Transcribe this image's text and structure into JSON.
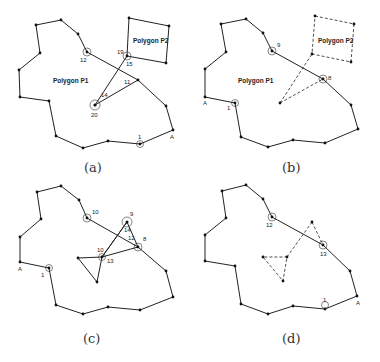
{
  "figure": {
    "panels": [
      {
        "id": "a",
        "caption": "(a)",
        "polygon_labels": [
          "Polygon P1",
          "Polygon P2"
        ],
        "vertex_labels": [
          "12",
          "19",
          "15",
          "11",
          "14",
          "20",
          "1",
          "A"
        ]
      },
      {
        "id": "b",
        "caption": "(b)",
        "polygon_labels": [
          "Polygon P1",
          "Polygon P2"
        ],
        "vertex_labels": [
          "9",
          "8",
          "1",
          "A"
        ]
      },
      {
        "id": "c",
        "caption": "(c)",
        "polygon_labels": [],
        "vertex_labels": [
          "10",
          "9",
          "8",
          "13",
          "10",
          "12",
          "14",
          "1",
          "A"
        ]
      },
      {
        "id": "d",
        "caption": "(d)",
        "polygon_labels": [],
        "vertex_labels": [
          "12",
          "13",
          "1",
          "A"
        ]
      }
    ]
  },
  "a": {
    "caption": "(a)",
    "p1": "Polygon P1",
    "p2": "Polygon P2",
    "l12": "12",
    "l19": "19",
    "l15": "15",
    "l11": "11",
    "l14": "14",
    "l20": "20",
    "l1": "1",
    "lA": "A"
  },
  "b": {
    "caption": "(b)",
    "p1": "Polygon P1",
    "p2": "Polygon P2",
    "l9": "9",
    "l8": "8",
    "l1": "1",
    "lA": "A"
  },
  "c": {
    "caption": "(c)",
    "l10": "10",
    "l9": "9",
    "l8": "8",
    "l13": "13",
    "l10b": "10",
    "l12": "12",
    "l14": "14",
    "l1": "1",
    "lA": "A"
  },
  "d": {
    "caption": "(d)",
    "l12": "12",
    "l13": "13",
    "l1": "1",
    "lA": "A"
  }
}
